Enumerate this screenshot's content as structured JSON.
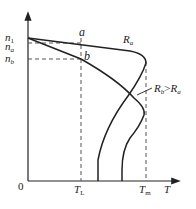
{
  "diagram": {
    "type": "speed-torque characteristic",
    "axes": {
      "origin_label": "0",
      "x_label": "T",
      "y_label_ticks": [
        "n1",
        "na",
        "nb"
      ],
      "x_ticks": [
        "TL",
        "Tm"
      ]
    },
    "y_ticks": {
      "n1": {
        "main": "n",
        "sub": "1"
      },
      "na": {
        "main": "n",
        "sub": "a"
      },
      "nb": {
        "main": "n",
        "sub": "b"
      }
    },
    "x_tick_labels": {
      "TL": {
        "main": "T",
        "sub": "L"
      },
      "Tm": {
        "main": "T",
        "sub": "m"
      }
    },
    "points": {
      "a": "a",
      "b": "b"
    },
    "curves": [
      {
        "name": "Ra",
        "label_main": "R",
        "label_sub": "a"
      },
      {
        "name": "Rb",
        "label_main": "R",
        "label_sub": "b",
        "annotation": "Rb>Ra",
        "comparator": ">",
        "compare_main": "R",
        "compare_sub": "a"
      }
    ],
    "colors": {
      "line": "#222222",
      "dash": "#555555",
      "background": "#ffffff"
    }
  }
}
